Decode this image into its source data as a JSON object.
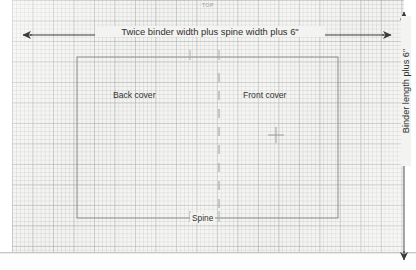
{
  "diagram": {
    "medium": "graph-paper",
    "orientation_label": "TOP",
    "dimensions": {
      "width_label": "Twice binder width plus spine width plus 6\"",
      "height_label": "Binder length plus 6\""
    },
    "regions": [
      {
        "id": "back-cover",
        "label": "Back cover"
      },
      {
        "id": "front-cover",
        "label": "Front cover"
      }
    ],
    "spine": {
      "label": "Spine",
      "line_style": "dashed"
    },
    "marks": [
      {
        "id": "registration-crosshair",
        "type": "plus",
        "x": 276,
        "y": 135
      },
      {
        "id": "spine-tick-left",
        "type": "tick",
        "x": 190,
        "y": 55
      },
      {
        "id": "spine-tick-right",
        "type": "tick",
        "x": 219,
        "y": 55
      }
    ],
    "colors": {
      "paper": "#f3f3f1",
      "grid_minor": "#b0b4b0",
      "grid_major": "#969e98",
      "ink": "#3a3a3a",
      "cover_outline": "#8d918d",
      "spine_dash": "#b8bcb8"
    }
  }
}
